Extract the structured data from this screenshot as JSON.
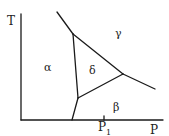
{
  "diagram": {
    "type": "phase-diagram",
    "axes": {
      "x_label": "P",
      "y_label": "T",
      "x_tick": {
        "label": "P",
        "subscript": "1"
      }
    },
    "phases": {
      "alpha": "α",
      "beta": "β",
      "gamma": "γ",
      "delta": "δ"
    }
  }
}
